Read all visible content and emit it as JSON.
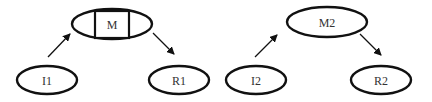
{
  "diagram": {
    "colors": {
      "stroke": "#111111",
      "text": "#333333",
      "background": "#ffffff"
    },
    "groups": [
      {
        "name": "group-1",
        "nodes": [
          {
            "id": "I1",
            "label": "I1",
            "cx": 47,
            "cy": 80,
            "rx": 30,
            "ry": 14
          },
          {
            "id": "M",
            "label": "M",
            "cx": 112,
            "cy": 24,
            "rx": 40,
            "ry": 15,
            "boxed": true
          },
          {
            "id": "R1",
            "label": "R1",
            "cx": 179,
            "cy": 80,
            "rx": 30,
            "ry": 14
          }
        ],
        "edges": [
          {
            "from": "I1",
            "to": "M"
          },
          {
            "from": "M",
            "to": "R1"
          }
        ]
      },
      {
        "name": "group-2",
        "nodes": [
          {
            "id": "I2",
            "label": "I2",
            "cx": 256,
            "cy": 80,
            "rx": 30,
            "ry": 14
          },
          {
            "id": "M2",
            "label": "M2",
            "cx": 327,
            "cy": 22,
            "rx": 40,
            "ry": 15
          },
          {
            "id": "R2",
            "label": "R2",
            "cx": 381,
            "cy": 80,
            "rx": 30,
            "ry": 14
          }
        ],
        "edges": [
          {
            "from": "I2",
            "to": "M2"
          },
          {
            "from": "M2",
            "to": "R2"
          }
        ]
      }
    ]
  }
}
